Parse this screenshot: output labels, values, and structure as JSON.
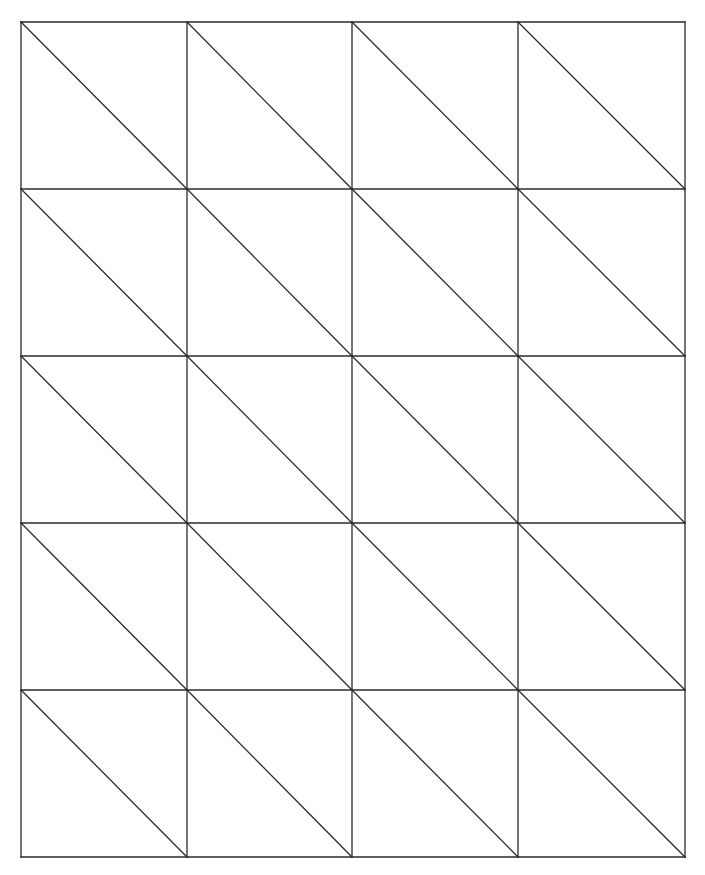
{
  "diagram": {
    "columns": 4,
    "rows": 5,
    "x_lines": [
      21,
      187,
      352,
      518,
      685
    ],
    "y_lines": [
      22,
      189,
      356,
      523,
      690,
      857
    ],
    "diagonal_direction": "top-left-to-bottom-right",
    "line_color": "#2a2a2a",
    "background_color": "#ffffff",
    "line_width": 1.3
  }
}
